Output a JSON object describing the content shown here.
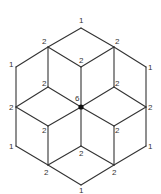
{
  "diagram": {
    "title": "",
    "line_color": "#333333",
    "vertices": [
      {
        "id": "top",
        "x": 81,
        "y": 28,
        "label": "1",
        "lx": 79,
        "ly": 23
      },
      {
        "id": "upper-left",
        "x": 48,
        "y": 47,
        "label": "2",
        "lx": 42,
        "ly": 44
      },
      {
        "id": "upper-right",
        "x": 114,
        "y": 47,
        "label": "2",
        "lx": 115,
        "ly": 44
      },
      {
        "id": "left-top",
        "x": 16,
        "y": 67,
        "label": "1",
        "lx": 9,
        "ly": 67
      },
      {
        "id": "right-top",
        "x": 146,
        "y": 67,
        "label": "1",
        "lx": 148,
        "ly": 70
      },
      {
        "id": "inner-top",
        "x": 81,
        "y": 67,
        "label": "2",
        "lx": 79,
        "ly": 63
      },
      {
        "id": "inner-upper-left",
        "x": 48,
        "y": 87,
        "label": "2",
        "lx": 42,
        "ly": 86
      },
      {
        "id": "inner-upper-right",
        "x": 114,
        "y": 87,
        "label": "2",
        "lx": 115,
        "ly": 86
      },
      {
        "id": "left-mid",
        "x": 16,
        "y": 107,
        "label": "2",
        "lx": 9,
        "ly": 110
      },
      {
        "id": "center",
        "x": 81,
        "y": 107,
        "label": "6",
        "lx": 75,
        "ly": 101
      },
      {
        "id": "right-mid",
        "x": 146,
        "y": 107,
        "label": "2",
        "lx": 148,
        "ly": 110
      },
      {
        "id": "inner-lower-left",
        "x": 48,
        "y": 126,
        "label": "2",
        "lx": 42,
        "ly": 133
      },
      {
        "id": "inner-lower-right",
        "x": 114,
        "y": 126,
        "label": "2",
        "lx": 115,
        "ly": 133
      },
      {
        "id": "left-bottom",
        "x": 16,
        "y": 146,
        "label": "1",
        "lx": 9,
        "ly": 149
      },
      {
        "id": "right-bottom",
        "x": 146,
        "y": 146,
        "label": "1",
        "lx": 148,
        "ly": 149
      },
      {
        "id": "inner-bottom",
        "x": 81,
        "y": 146,
        "label": "2",
        "lx": 79,
        "ly": 156
      },
      {
        "id": "lower-left",
        "x": 48,
        "y": 165,
        "label": "2",
        "lx": 44,
        "ly": 175
      },
      {
        "id": "lower-right",
        "x": 114,
        "y": 165,
        "label": "2",
        "lx": 112,
        "ly": 175
      },
      {
        "id": "bottom",
        "x": 81,
        "y": 185,
        "label": "1",
        "lx": 79,
        "ly": 193
      }
    ],
    "edges": [
      [
        "top",
        "upper-left"
      ],
      [
        "top",
        "upper-right"
      ],
      [
        "upper-left",
        "left-top"
      ],
      [
        "upper-right",
        "right-top"
      ],
      [
        "left-top",
        "left-mid"
      ],
      [
        "right-top",
        "right-mid"
      ],
      [
        "left-mid",
        "left-bottom"
      ],
      [
        "right-mid",
        "right-bottom"
      ],
      [
        "left-bottom",
        "lower-left"
      ],
      [
        "right-bottom",
        "lower-right"
      ],
      [
        "lower-left",
        "bottom"
      ],
      [
        "lower-right",
        "bottom"
      ],
      [
        "upper-left",
        "inner-top"
      ],
      [
        "upper-right",
        "inner-top"
      ],
      [
        "upper-left",
        "inner-upper-left"
      ],
      [
        "upper-right",
        "inner-upper-right"
      ],
      [
        "inner-top",
        "center"
      ],
      [
        "inner-upper-left",
        "center"
      ],
      [
        "inner-upper-right",
        "center"
      ],
      [
        "inner-upper-left",
        "left-mid"
      ],
      [
        "inner-upper-right",
        "right-mid"
      ],
      [
        "left-mid",
        "inner-lower-left"
      ],
      [
        "right-mid",
        "inner-lower-right"
      ],
      [
        "center",
        "inner-lower-left"
      ],
      [
        "center",
        "inner-lower-right"
      ],
      [
        "inner-lower-left",
        "lower-left"
      ],
      [
        "inner-lower-right",
        "lower-right"
      ],
      [
        "center",
        "inner-bottom"
      ],
      [
        "inner-bottom",
        "lower-left"
      ],
      [
        "inner-bottom",
        "lower-right"
      ]
    ],
    "highlighted_vertex": "center"
  }
}
